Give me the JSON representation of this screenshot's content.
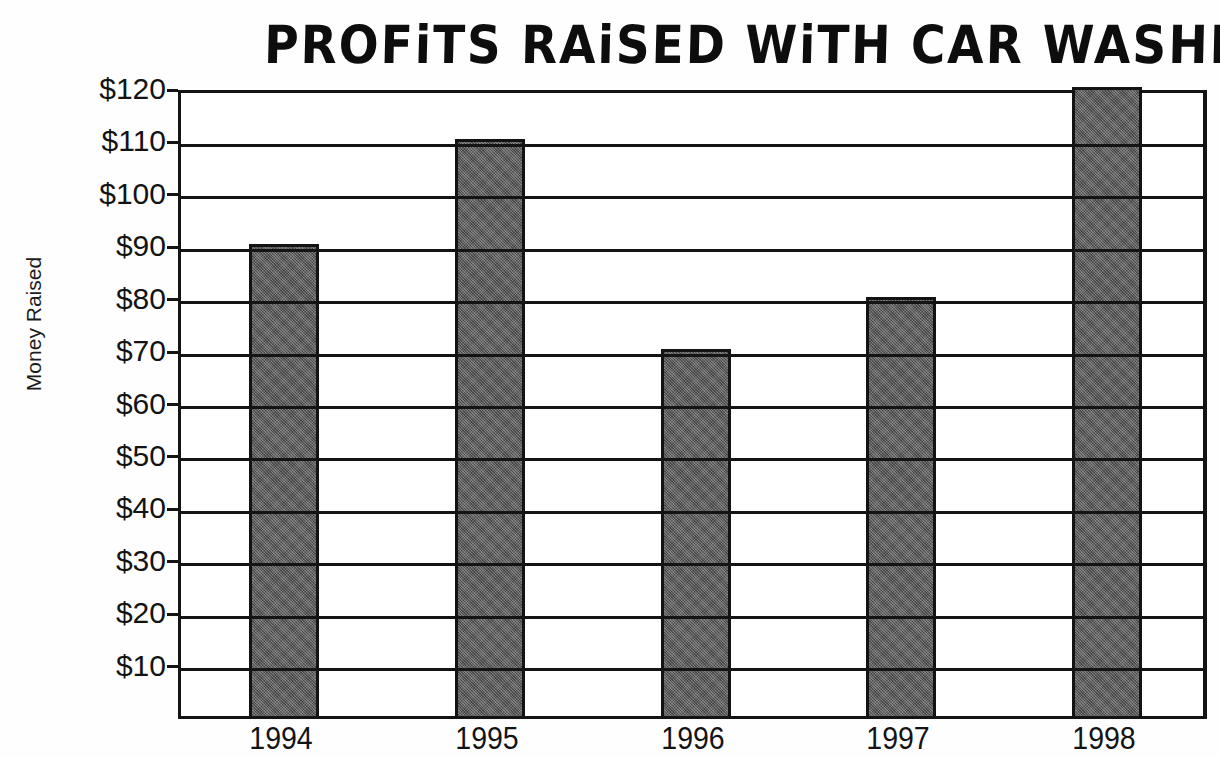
{
  "chart_data": {
    "type": "bar",
    "title": "PROFiTS RAiSED WiTH CAR WASHES",
    "xlabel": "",
    "ylabel": "Money Raised",
    "categories": [
      "1994",
      "1995",
      "1996",
      "1997",
      "1998"
    ],
    "values": [
      90,
      110,
      70,
      80,
      120
    ],
    "series": [
      {
        "name": "Money Raised",
        "values": [
          90,
          110,
          70,
          80,
          120
        ]
      }
    ],
    "ylim": [
      0,
      120
    ],
    "ytick_values": [
      10,
      20,
      30,
      40,
      50,
      60,
      70,
      80,
      90,
      100,
      110,
      120
    ],
    "ytick_labels": [
      "$10",
      "$20",
      "$30",
      "$40",
      "$50",
      "$60",
      "$70",
      "$80",
      "$90",
      "$100",
      "$110",
      "$120"
    ],
    "grid": true,
    "grid_axis": "y",
    "legend": false,
    "legend_position": "none",
    "bar_color": "#5b5b5b",
    "bar_edge_color": "#131313",
    "axis_color": "#141414",
    "background_color": "#ffffff",
    "text_color": "#131313"
  }
}
